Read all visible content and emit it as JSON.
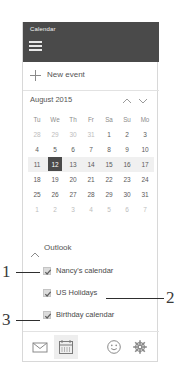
{
  "app": {
    "title": "Calendar",
    "menu_icon": "hamburger-icon"
  },
  "new_event": {
    "label": "New event",
    "icon": "plus-icon"
  },
  "calendar": {
    "month_label": "August 2015",
    "prev_icon": "chevron-up-icon",
    "next_icon": "chevron-down-icon",
    "day_headers": [
      "Tu",
      "We",
      "Th",
      "Fr",
      "Sa",
      "Su",
      "Mo"
    ],
    "weeks": [
      [
        {
          "d": "28",
          "other": true
        },
        {
          "d": "29",
          "other": true
        },
        {
          "d": "30",
          "other": true
        },
        {
          "d": "31",
          "other": true
        },
        {
          "d": "1"
        },
        {
          "d": "2"
        },
        {
          "d": "3"
        }
      ],
      [
        {
          "d": "4"
        },
        {
          "d": "5"
        },
        {
          "d": "6"
        },
        {
          "d": "7"
        },
        {
          "d": "8"
        },
        {
          "d": "9"
        },
        {
          "d": "10"
        }
      ],
      [
        {
          "d": "11"
        },
        {
          "d": "12",
          "selected": true
        },
        {
          "d": "13"
        },
        {
          "d": "14"
        },
        {
          "d": "15"
        },
        {
          "d": "16"
        },
        {
          "d": "17"
        }
      ],
      [
        {
          "d": "18"
        },
        {
          "d": "19"
        },
        {
          "d": "20"
        },
        {
          "d": "21"
        },
        {
          "d": "22"
        },
        {
          "d": "23"
        },
        {
          "d": "24"
        }
      ],
      [
        {
          "d": "25"
        },
        {
          "d": "26"
        },
        {
          "d": "27"
        },
        {
          "d": "28"
        },
        {
          "d": "29"
        },
        {
          "d": "30"
        },
        {
          "d": "31"
        }
      ],
      [
        {
          "d": "1",
          "other": true
        },
        {
          "d": "2",
          "other": true
        },
        {
          "d": "3",
          "other": true
        },
        {
          "d": "4",
          "other": true
        },
        {
          "d": "5",
          "other": true
        },
        {
          "d": "6",
          "other": true
        },
        {
          "d": "7",
          "other": true
        }
      ]
    ],
    "selected_date": "12",
    "highlight_week_index": 2
  },
  "outlook": {
    "group_label": "Outlook",
    "collapse_icon": "chevron-up-icon",
    "calendars": [
      {
        "label": "Nancy's calendar",
        "checked": true
      },
      {
        "label": "US Holidays",
        "checked": true
      },
      {
        "label": "Birthday calendar",
        "checked": true
      }
    ]
  },
  "toolbar": {
    "mail": {
      "icon": "mail-icon",
      "active": false
    },
    "calendar": {
      "icon": "calendar-icon",
      "active": true
    },
    "people": {
      "icon": "smiley-face-icon",
      "active": false
    },
    "settings": {
      "icon": "gear-icon",
      "active": false
    }
  },
  "annotations": [
    {
      "number": "1",
      "target": "Nancy's calendar"
    },
    {
      "number": "2",
      "target": "US Holidays"
    },
    {
      "number": "3",
      "target": "Birthday calendar"
    }
  ],
  "colors": {
    "titlebar": "#4a4a4a",
    "selected_day": "#4a4a4a",
    "week_highlight": "#f0f0f0",
    "panel_border": "#d8d8d8"
  }
}
